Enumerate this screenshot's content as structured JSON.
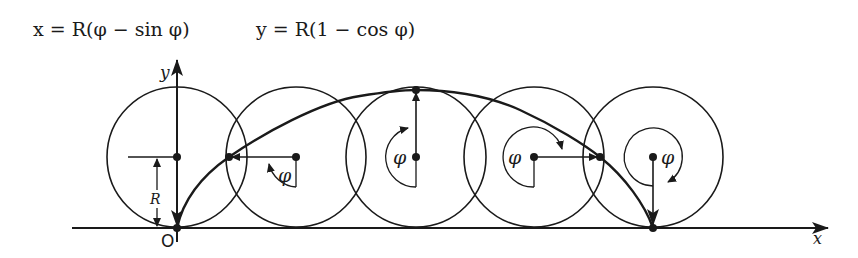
{
  "equations": {
    "x_eq": "x = R(φ − sin φ)",
    "y_eq": "y = R(1 − cos φ)"
  },
  "axes": {
    "x_label": "x",
    "y_label": "y",
    "origin_label": "O"
  },
  "labels": {
    "radius": "R",
    "angle": "φ"
  },
  "circles": [
    {
      "cx": 177,
      "angle_label": ""
    },
    {
      "cx": 296,
      "angle_label": "φ"
    },
    {
      "cx": 416,
      "angle_label": "φ"
    },
    {
      "cx": 534,
      "angle_label": "φ"
    },
    {
      "cx": 653,
      "angle_label": "φ"
    }
  ],
  "colors": {
    "ink": "#1a1a1a",
    "background": "#ffffff"
  }
}
